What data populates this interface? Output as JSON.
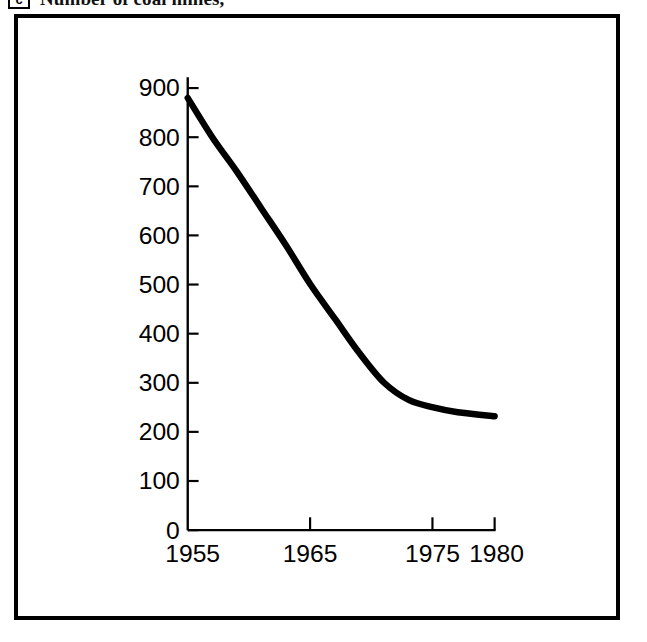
{
  "caption": {
    "badge": "c",
    "text": "Number of coal mines,",
    "note": "title cropped at top edge of image"
  },
  "figure": {
    "frame_color": "#000000",
    "background": "#ffffff",
    "line_color": "#000000"
  },
  "chart_data": {
    "type": "line",
    "title": "Number of coal mines,",
    "xlabel": "",
    "ylabel": "",
    "xlim": [
      1955,
      1980
    ],
    "ylim": [
      0,
      900
    ],
    "grid": false,
    "legend": null,
    "xticks": [
      1955,
      1965,
      1975,
      1980
    ],
    "xtick_labels": [
      "1955",
      "1965",
      "1975",
      "1980"
    ],
    "yticks": [
      0,
      100,
      200,
      300,
      400,
      500,
      600,
      700,
      800,
      900
    ],
    "ytick_labels": [
      "0",
      "100",
      "200",
      "300",
      "400",
      "500",
      "600",
      "700",
      "800",
      "900"
    ],
    "series": [
      {
        "name": "Number of coal mines",
        "x": [
          1955,
          1957,
          1959,
          1961,
          1963,
          1965,
          1967,
          1969,
          1971,
          1973,
          1975,
          1977,
          1980
        ],
        "values": [
          880,
          800,
          730,
          655,
          580,
          500,
          430,
          360,
          300,
          265,
          250,
          240,
          232
        ]
      }
    ]
  }
}
